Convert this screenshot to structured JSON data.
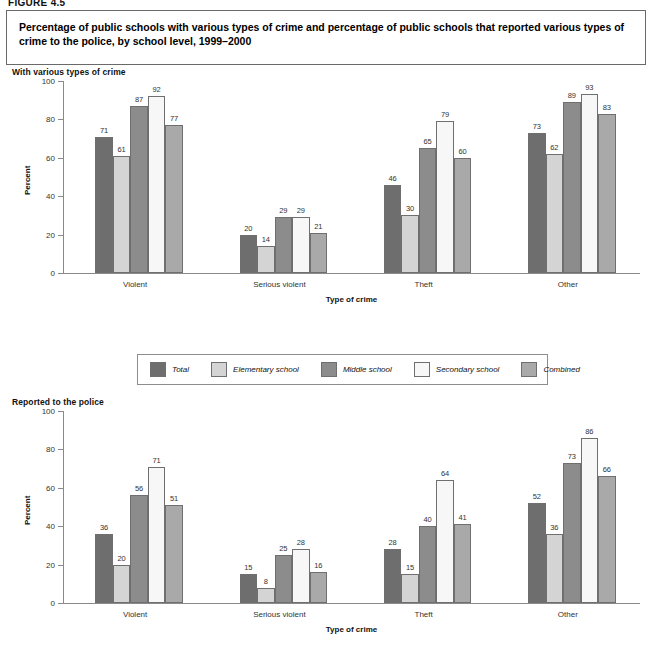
{
  "figure_label": "FIGURE 4.5",
  "title": "Percentage of public schools with various types of crime and percentage of public schools that reported various types of crime to the police, by school level, 1999–2000",
  "legend": {
    "items": [
      {
        "label": "Total",
        "color": "#6e6e6e"
      },
      {
        "label": "Elementary school",
        "color": "#d4d4d4"
      },
      {
        "label": "Middle school",
        "color": "#8c8c8c"
      },
      {
        "label": "Secondary school",
        "color": "#f7f7f7"
      },
      {
        "label": "Combined",
        "color": "#a9a9a9"
      }
    ]
  },
  "chart_data": [
    {
      "type": "bar",
      "title": "With various types of crime",
      "xlabel": "Type of crime",
      "ylabel": "Percent",
      "ylim": [
        0,
        100
      ],
      "yticks": [
        0,
        20,
        40,
        60,
        80,
        100
      ],
      "grid": false,
      "legend_position": "below",
      "categories": [
        "Violent",
        "Serious violent",
        "Theft",
        "Other"
      ],
      "series": [
        {
          "name": "Total",
          "color": "#6e6e6e",
          "values": [
            71,
            20,
            46,
            73
          ]
        },
        {
          "name": "Elementary school",
          "color": "#d4d4d4",
          "values": [
            61,
            14,
            30,
            62
          ]
        },
        {
          "name": "Middle school",
          "color": "#8c8c8c",
          "values": [
            87,
            29,
            65,
            89
          ]
        },
        {
          "name": "Secondary school",
          "color": "#f7f7f7",
          "values": [
            92,
            29,
            79,
            93
          ]
        },
        {
          "name": "Combined",
          "color": "#a9a9a9",
          "values": [
            77,
            21,
            60,
            83
          ]
        }
      ]
    },
    {
      "type": "bar",
      "title": "Reported to the police",
      "xlabel": "Type of crime",
      "ylabel": "Percent",
      "ylim": [
        0,
        100
      ],
      "yticks": [
        0,
        20,
        40,
        60,
        80,
        100
      ],
      "grid": false,
      "legend_position": "above",
      "categories": [
        "Violent",
        "Serious violent",
        "Theft",
        "Other"
      ],
      "series": [
        {
          "name": "Total",
          "color": "#6e6e6e",
          "values": [
            36,
            15,
            28,
            52
          ]
        },
        {
          "name": "Elementary school",
          "color": "#d4d4d4",
          "values": [
            20,
            8,
            15,
            36
          ]
        },
        {
          "name": "Middle school",
          "color": "#8c8c8c",
          "values": [
            56,
            25,
            40,
            73
          ]
        },
        {
          "name": "Secondary school",
          "color": "#f7f7f7",
          "values": [
            71,
            28,
            64,
            86
          ]
        },
        {
          "name": "Combined",
          "color": "#a9a9a9",
          "values": [
            51,
            16,
            41,
            66
          ]
        }
      ]
    }
  ]
}
